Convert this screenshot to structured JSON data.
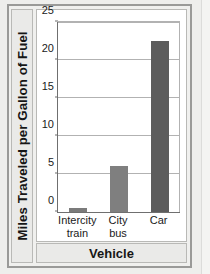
{
  "figure": {
    "kind": "bar-chart",
    "frame_color": "#9a9a98",
    "plot_background": "#ffffff",
    "page_background": "#eeeeec"
  },
  "chart_data": {
    "type": "bar",
    "title": "",
    "subtitle": "",
    "xlabel": "Vehicle",
    "ylabel": "Miles Traveled per Gallon of Fuel",
    "categories": [
      "Intercity train",
      "City bus",
      "Car"
    ],
    "category_lines": [
      [
        "Intercity",
        "train"
      ],
      [
        "City",
        "bus"
      ],
      [
        "Car"
      ]
    ],
    "values": [
      0.5,
      6,
      22.5
    ],
    "ylim": [
      0,
      25
    ],
    "yticks": [
      0,
      5,
      10,
      15,
      20,
      25
    ],
    "ytick_labels": [
      "0",
      "5",
      "10",
      "15",
      "20",
      "25"
    ],
    "grid": true,
    "grid_axis": "y",
    "legend": false,
    "legend_position": "none",
    "bar_colors": [
      "#7b7b7b",
      "#7f7f7f",
      "#5c5c5c"
    ],
    "grid_color": "#b2b2b2",
    "axis_color": "#6f6f6f"
  }
}
